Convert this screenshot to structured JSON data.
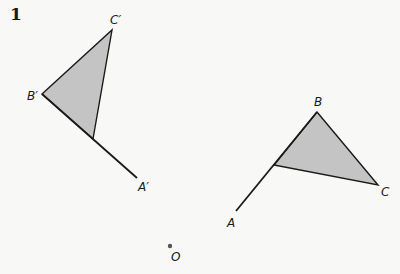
{
  "problem": {
    "number": "1"
  },
  "diagram": {
    "fill_color": "#c4c4c4",
    "stroke_color": "#1a1a1a",
    "image_figure": {
      "triangle_label": "A'B'C'",
      "points": {
        "B_prime": {
          "label": "B′",
          "x": 42,
          "y": 94
        },
        "C_prime": {
          "label": "C′",
          "x": 112,
          "y": 30
        },
        "A_prime": {
          "label": "A′",
          "x": 137,
          "y": 178
        }
      },
      "triangle_vertex_on_ray": {
        "x": 93,
        "y": 139
      }
    },
    "original_figure": {
      "triangle_label": "ABC",
      "points": {
        "B": {
          "label": "B",
          "x": 317,
          "y": 112
        },
        "C": {
          "label": "C",
          "x": 378,
          "y": 185
        },
        "A": {
          "label": "A",
          "x": 236,
          "y": 211
        }
      },
      "triangle_vertex_on_ray": {
        "x": 274,
        "y": 165
      }
    },
    "center": {
      "label": "O",
      "x": 170,
      "y": 246
    }
  }
}
